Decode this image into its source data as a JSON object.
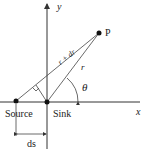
{
  "diagram": {
    "axes": {
      "x_label": "x",
      "y_label": "y"
    },
    "points": {
      "source": {
        "label": "Source",
        "x": 16,
        "y": 101
      },
      "sink": {
        "label": "Sink",
        "x": 47,
        "y": 102
      },
      "p": {
        "label": "P",
        "x": 99,
        "y": 33
      }
    },
    "segments": {
      "source_to_p": "r + dr",
      "sink_to_p": "r"
    },
    "angle_label": "θ",
    "dimension_label": "ds",
    "colors": {
      "line": "#333333",
      "point": "#111111"
    }
  }
}
